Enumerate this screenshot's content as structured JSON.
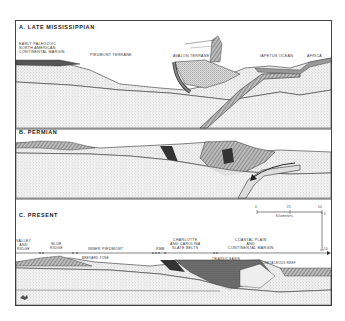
{
  "figure": {
    "panels": [
      {
        "id": "A",
        "title": "A. LATE MISSISSIPPIAN",
        "labels": {
          "margin": [
            "EARLY PALEOZOIC",
            "NORTH AMERICAN",
            "CONTINENTAL MARGIN"
          ],
          "piedmont": "PIEDMONT  TERRANE",
          "avalon": "AVALON  TERRANE",
          "iapetus": "IAPETUS OCEAN",
          "africa": "AFRICA"
        }
      },
      {
        "id": "B",
        "title": "B. PERMIAN"
      },
      {
        "id": "C",
        "title": "C. PRESENT",
        "labels": {
          "valley_ridge": [
            "VALLEY",
            "AND",
            "RIDGE"
          ],
          "blue_ridge": [
            "BLUE",
            "RIDGE"
          ],
          "inner_piedmont": "INNER  PIEDMONT",
          "kmb": "KMB",
          "charlotte": [
            "CHARLOTTE",
            "AND CAROLINA",
            "SLATE BELTS"
          ],
          "coastal": [
            "COASTAL PLAIN",
            "AND",
            "CONTINENTAL   MARGIN"
          ],
          "brevard": "BREVARD  ZONE",
          "triassic": "TRIASSIC BASIN",
          "cretaceous": "CRETACEOUS REEF"
        },
        "scale": {
          "ticks": [
            "0",
            "25",
            "50"
          ],
          "unit": "Kilometers",
          "vertical_ticks": [
            "0",
            "50"
          ]
        }
      }
    ],
    "colors": {
      "line": "#333333",
      "stipple_light": "#e9e9e9",
      "stipple_mid": "#d6d6d6",
      "dark_fill": "#555555",
      "slab": "#8a8a8a"
    }
  }
}
